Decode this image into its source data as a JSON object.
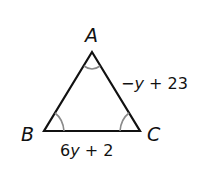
{
  "diagram": {
    "type": "isosceles-triangle",
    "vertices": {
      "A": {
        "label": "A"
      },
      "B": {
        "label": "B"
      },
      "C": {
        "label": "C"
      }
    },
    "sides": {
      "AC": {
        "expr_prefix": "−",
        "expr_var": "y",
        "expr_suffix": " + 23"
      },
      "BC": {
        "expr_prefix": "6",
        "expr_var": "y",
        "expr_suffix": " + 2"
      }
    },
    "angle_marks": [
      "A",
      "B",
      "C"
    ],
    "colors": {
      "stroke": "#111111",
      "angle_arc": "#8a8a8a",
      "background": "#ffffff"
    }
  }
}
